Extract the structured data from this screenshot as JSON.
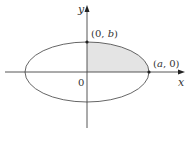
{
  "figure": {
    "type": "ellipse-area-diagram",
    "labels": {
      "y_axis": "y",
      "x_axis": "x",
      "origin": "0",
      "top_point": "(0, b)",
      "top_point_open": "(0, ",
      "top_point_var": "b",
      "top_point_close": ")",
      "right_point_open": "(",
      "right_point_var": "a",
      "right_point_close": ", 0)"
    },
    "points": [
      {
        "name": "(0,b)",
        "role": "top vertex on y-axis"
      },
      {
        "name": "(a,0)",
        "role": "right vertex on x-axis"
      }
    ],
    "shaded_region": "first quadrant quarter of ellipse",
    "colors": {
      "stroke": "#555555",
      "axis": "#444444",
      "shade": "#e4e4e4",
      "point": "#222222"
    }
  }
}
